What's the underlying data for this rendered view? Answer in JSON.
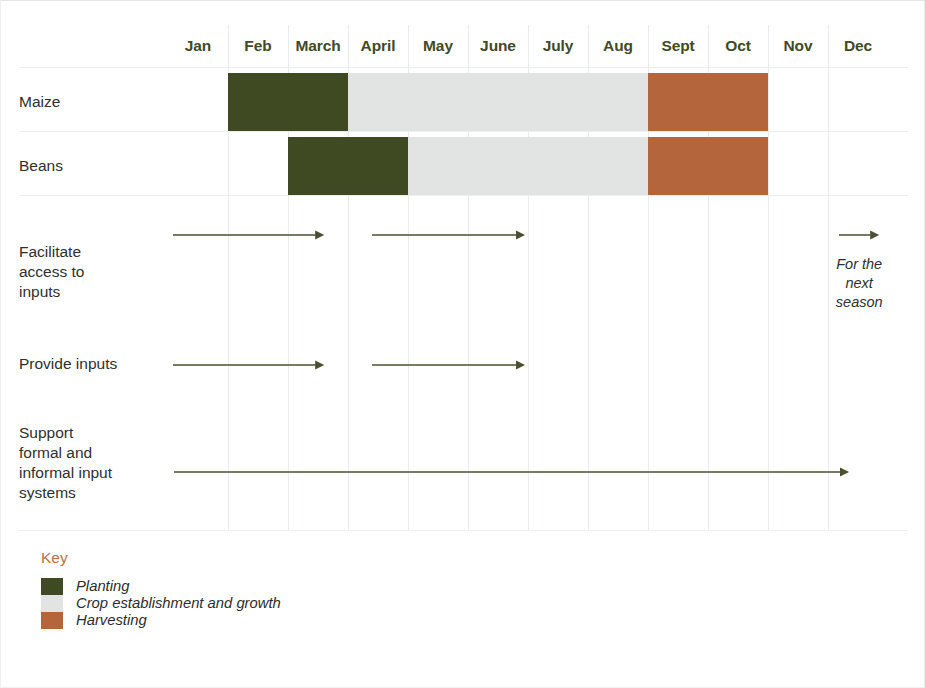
{
  "chart_data": {
    "type": "table",
    "xlabel": "",
    "ylabel": "",
    "grid": true,
    "legend_position": "bottom-left",
    "categories": [
      "Jan",
      "Feb",
      "March",
      "April",
      "May",
      "June",
      "July",
      "Aug",
      "Sept",
      "Oct",
      "Nov",
      "Dec"
    ],
    "stage_colors": {
      "planting": "#3f4a23",
      "growth": "#e2e4e3",
      "harvest": "#b5653c",
      "empty": "transparent"
    },
    "crop_rows": [
      {
        "label": "Maize",
        "cells": [
          "empty",
          "planting",
          "planting",
          "growth",
          "growth",
          "growth",
          "growth",
          "growth",
          "harvest",
          "harvest",
          "empty",
          "empty"
        ]
      },
      {
        "label": "Beans",
        "cells": [
          "empty",
          "empty",
          "planting",
          "planting",
          "growth",
          "growth",
          "growth",
          "growth",
          "harvest",
          "harvest",
          "empty",
          "empty"
        ]
      }
    ],
    "activity_rows": [
      {
        "label": "Facilitate access to inputs",
        "label_lines": [
          "Facilitate",
          "access to",
          "inputs"
        ],
        "arrows": [
          {
            "start_month": "Jan",
            "end_month": "March",
            "start_frac": 0.08,
            "end_frac": 2.6
          },
          {
            "start_month": "April",
            "end_month": "June",
            "start_frac": 3.4,
            "end_frac": 5.95
          }
        ],
        "note": {
          "text": "For the next season",
          "lines": [
            "For the",
            "next",
            "season"
          ],
          "month": "Dec",
          "arrow": {
            "start_frac": 11.18,
            "end_frac": 11.85
          }
        }
      },
      {
        "label": "Provide inputs",
        "label_lines": [
          "Provide inputs"
        ],
        "arrows": [
          {
            "start_month": "Jan",
            "end_month": "March",
            "start_frac": 0.08,
            "end_frac": 2.6
          },
          {
            "start_month": "April",
            "end_month": "June",
            "start_frac": 3.4,
            "end_frac": 5.95
          }
        ]
      },
      {
        "label": "Support formal and informal input systems",
        "label_lines": [
          "Support",
          "formal and",
          "informal input",
          "systems"
        ],
        "arrows": [
          {
            "start_month": "Jan",
            "end_month": "Dec",
            "start_frac": 0.1,
            "end_frac": 11.35
          }
        ]
      }
    ],
    "legend": {
      "title": "Key",
      "title_color": "#c1703f",
      "entries": [
        {
          "label": "Planting",
          "color": "#3f4a23"
        },
        {
          "label": "Crop establishment and growth",
          "color": "#e2e4e3"
        },
        {
          "label": "Harvesting",
          "color": "#b5653c"
        }
      ]
    },
    "arrow_color": "#4a5030"
  }
}
